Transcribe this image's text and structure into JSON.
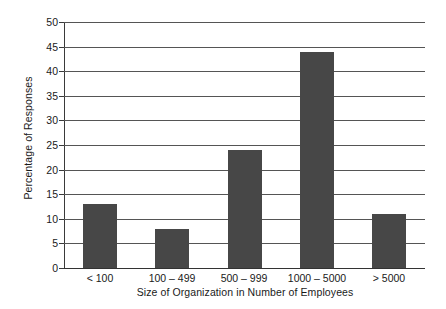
{
  "chart_data": {
    "type": "bar",
    "title": "",
    "subtitle": "",
    "xlabel": "Size of Organization in Number of Employees",
    "ylabel": "Percentage of Responses",
    "categories": [
      "< 100",
      "100 – 499",
      "500 – 999",
      "1000 – 5000",
      "> 5000"
    ],
    "values": [
      13,
      8,
      24,
      44,
      11
    ],
    "series": [
      {
        "name": "Percentage of Responses",
        "values": [
          13,
          8,
          24,
          44,
          11
        ]
      }
    ],
    "ylim": [
      0,
      50
    ],
    "ytick_step": 5,
    "yticks": [
      0,
      5,
      10,
      15,
      20,
      25,
      30,
      35,
      40,
      45,
      50
    ],
    "ytick_labels": [
      "0",
      "5",
      "10",
      "15",
      "20",
      "25",
      "30",
      "35",
      "40",
      "45",
      "50"
    ],
    "grid": "horizontal",
    "legend": "none",
    "bar_color": "#474747",
    "gridline_color": "#555555",
    "axis_color": "#3a3a3a",
    "background_color": "#ffffff",
    "annotations": []
  }
}
